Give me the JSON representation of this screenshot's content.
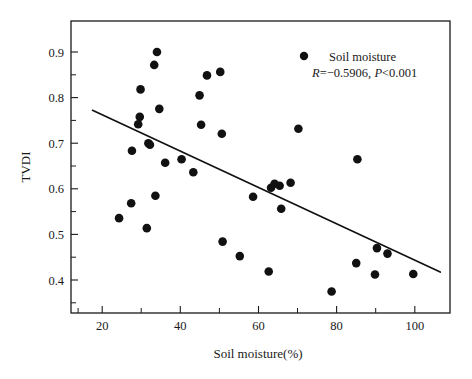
{
  "chart_data": {
    "type": "scatter",
    "title": "",
    "xlabel": "Soil moisture(%)",
    "ylabel": "TVDI",
    "xlim": [
      12,
      109
    ],
    "ylim": [
      0.36,
      0.945
    ],
    "xticks": [
      20,
      40,
      60,
      80,
      100
    ],
    "xtick_labels": [
      "20",
      "40",
      "60",
      "80",
      "100"
    ],
    "xticks_minor": [
      30,
      50,
      70,
      90
    ],
    "yticks": [
      0.4,
      0.5,
      0.6,
      0.7,
      0.8,
      0.9
    ],
    "ytick_labels": [
      "0.4",
      "0.5",
      "0.6",
      "0.7",
      "0.8",
      "0.9"
    ],
    "yticks_minor": [
      0.45,
      0.55,
      0.65,
      0.75,
      0.85
    ],
    "grid": false,
    "legend_position": "top-right",
    "marker": "filled-circle",
    "marker_color": "#111111",
    "series": [
      {
        "name": "Soil moisture",
        "points": [
          {
            "x": 24.3,
            "y": 0.55
          },
          {
            "x": 27.4,
            "y": 0.58
          },
          {
            "x": 27.6,
            "y": 0.685
          },
          {
            "x": 29.2,
            "y": 0.738
          },
          {
            "x": 29.6,
            "y": 0.753
          },
          {
            "x": 29.8,
            "y": 0.808
          },
          {
            "x": 31.4,
            "y": 0.53
          },
          {
            "x": 31.8,
            "y": 0.7
          },
          {
            "x": 32.2,
            "y": 0.697
          },
          {
            "x": 33.3,
            "y": 0.857
          },
          {
            "x": 33.6,
            "y": 0.595
          },
          {
            "x": 34.0,
            "y": 0.883
          },
          {
            "x": 34.6,
            "y": 0.769
          },
          {
            "x": 36.1,
            "y": 0.661
          },
          {
            "x": 40.3,
            "y": 0.668
          },
          {
            "x": 43.3,
            "y": 0.642
          },
          {
            "x": 44.9,
            "y": 0.796
          },
          {
            "x": 45.3,
            "y": 0.737
          },
          {
            "x": 46.8,
            "y": 0.836
          },
          {
            "x": 50.2,
            "y": 0.843
          },
          {
            "x": 50.6,
            "y": 0.719
          },
          {
            "x": 50.8,
            "y": 0.503
          },
          {
            "x": 55.2,
            "y": 0.474
          },
          {
            "x": 58.6,
            "y": 0.593
          },
          {
            "x": 62.6,
            "y": 0.443
          },
          {
            "x": 63.2,
            "y": 0.611
          },
          {
            "x": 64.1,
            "y": 0.619
          },
          {
            "x": 65.4,
            "y": 0.615
          },
          {
            "x": 65.8,
            "y": 0.569
          },
          {
            "x": 68.2,
            "y": 0.621
          },
          {
            "x": 70.2,
            "y": 0.729
          },
          {
            "x": 78.7,
            "y": 0.403
          },
          {
            "x": 85.0,
            "y": 0.46
          },
          {
            "x": 85.3,
            "y": 0.668
          },
          {
            "x": 89.8,
            "y": 0.437
          },
          {
            "x": 90.3,
            "y": 0.49
          },
          {
            "x": 93.0,
            "y": 0.479
          },
          {
            "x": 99.6,
            "y": 0.438
          }
        ]
      }
    ],
    "fit_line": {
      "type": "linear-regression",
      "x_start": 17.5,
      "y_start": 0.766,
      "x_end": 106.5,
      "y_end": 0.442
    },
    "annotations": {
      "correlation": "R=−0.5906, P<0.001",
      "r_symbol": "R",
      "r_value": "=−0.5906, ",
      "p_symbol": "P",
      "p_value": "<0.001"
    }
  },
  "legend": {
    "entry_label": "Soil moisture"
  }
}
